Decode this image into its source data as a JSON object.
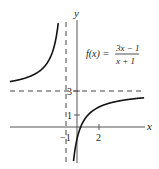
{
  "chart_data": {
    "type": "line",
    "title": "",
    "function_label": {
      "lhs": "f(x) =",
      "numerator": "3x − 1",
      "denominator": "x + 1"
    },
    "xlabel": "x",
    "ylabel": "y",
    "x_ticks": [
      {
        "value": -1,
        "label": "−1"
      },
      {
        "value": 2,
        "label": "2"
      }
    ],
    "y_ticks": [
      {
        "value": 1,
        "label": "1"
      },
      {
        "value": 3,
        "label": "3"
      }
    ],
    "asymptotes": {
      "vertical": -1,
      "horizontal": 3
    },
    "series": [
      {
        "name": "left branch",
        "x": [
          -6.1,
          -5,
          -4,
          -3,
          -2,
          -1.6,
          -1.4,
          -1.25
        ],
        "y": [
          3.78,
          4.0,
          4.33,
          5.0,
          7.0,
          9.67,
          13.0,
          19.0
        ]
      },
      {
        "name": "right branch",
        "x": [
          -0.75,
          -0.5,
          -0.25,
          0,
          0.333,
          1,
          2,
          3,
          4,
          5.8
        ],
        "y": [
          -13.0,
          -5.0,
          -2.33,
          -1.0,
          0.0,
          1.0,
          1.67,
          2.0,
          2.2,
          2.46
        ]
      }
    ],
    "xlim": [
      -6.1,
      6.2
    ],
    "ylim": [
      -3,
      9
    ],
    "grid": false,
    "colors": {
      "curve": "#111111",
      "axes": "#333333",
      "dashed": "#444444"
    }
  }
}
